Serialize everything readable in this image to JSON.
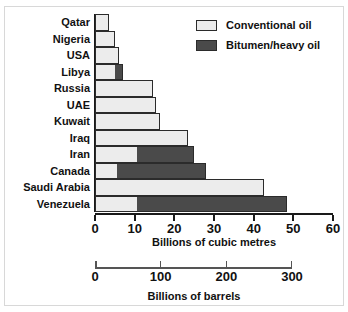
{
  "chart_data": {
    "type": "bar",
    "orientation": "horizontal",
    "stacked": true,
    "title": "",
    "xlabel": "Billions of cubic metres",
    "ylabel": "",
    "xlim": [
      0,
      60
    ],
    "grid": false,
    "legend_position": "top-right",
    "categories": [
      "Qatar",
      "Nigeria",
      "USA",
      "Libya",
      "Russia",
      "UAE",
      "Kuwait",
      "Iraq",
      "Iran",
      "Canada",
      "Saudi Arabia",
      "Venezuela"
    ],
    "series": [
      {
        "name": "Conventional oil",
        "color": "#ececec",
        "values": [
          3.5,
          5,
          6,
          5,
          14.5,
          15.5,
          16.5,
          23.5,
          10.5,
          5.5,
          42.5,
          10.5
        ]
      },
      {
        "name": "Bitumen/heavy oil",
        "color": "#4a4a4a",
        "values": [
          0,
          0,
          0,
          2,
          0,
          0,
          0,
          0,
          14.5,
          22.5,
          0,
          38
        ]
      }
    ],
    "totals": [
      3.5,
      5,
      6,
      7,
      14.5,
      15.5,
      16.5,
      23.5,
      25,
      28,
      42.5,
      48.5
    ],
    "primary_axis": {
      "label": "Billions of cubic metres",
      "ticks": [
        0,
        10,
        20,
        30,
        40,
        50,
        60
      ],
      "tick_labels": [
        "0",
        "10",
        "20",
        "30",
        "40",
        "50",
        "60"
      ],
      "min": 0,
      "max": 60
    },
    "secondary_axis": {
      "label": "Billions of barrels",
      "ticks": [
        0,
        100,
        200,
        300
      ],
      "tick_labels": [
        "0",
        "100",
        "200",
        "300"
      ],
      "min": 0,
      "max": 300
    }
  },
  "legend": {
    "items": [
      {
        "label": "Conventional oil",
        "kind": "conv"
      },
      {
        "label": "Bitumen/heavy oil",
        "kind": "bit"
      }
    ]
  },
  "colors": {
    "conventional": "#ececec",
    "bitumen": "#4a4a4a",
    "axis": "#1a1a1a",
    "text": "#111111",
    "background": "#ffffff"
  }
}
